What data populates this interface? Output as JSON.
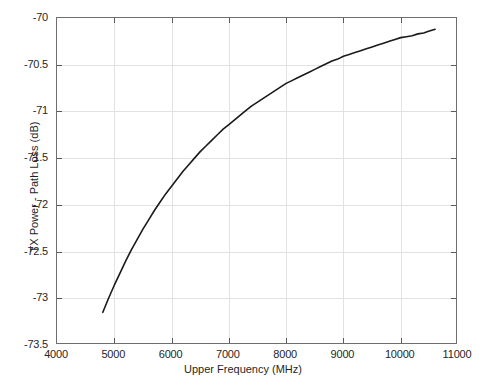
{
  "chart_data": {
    "type": "line",
    "title": "",
    "xlabel": "Upper Frequency (MHz)",
    "ylabel": "TX Power - Path Loss (dB)",
    "xlim": [
      4000,
      11000
    ],
    "ylim": [
      -73.5,
      -70
    ],
    "xticks": [
      4000,
      5000,
      6000,
      7000,
      8000,
      9000,
      10000,
      11000
    ],
    "xticklabels": [
      "4000",
      "5000",
      "6000",
      "7000",
      "8000",
      "9000",
      "10000",
      "11000"
    ],
    "yticks": [
      -73.5,
      -73,
      -72.5,
      -72,
      -71.5,
      -71,
      -70.5,
      -70
    ],
    "yticklabels": [
      "-73.5",
      "-73",
      "-72.5",
      "-72",
      "-71.5",
      "-71",
      "-70.5",
      "-70"
    ],
    "grid": true,
    "legend": null,
    "series": [
      {
        "name": "TX Power - Path Loss",
        "color": "#1a1a1a",
        "linewidth": 1.6,
        "x": [
          4800,
          4900,
          5000,
          5100,
          5200,
          5300,
          5400,
          5500,
          5600,
          5700,
          5800,
          5900,
          6000,
          6100,
          6200,
          6300,
          6400,
          6500,
          6600,
          6700,
          6800,
          6900,
          7000,
          7100,
          7200,
          7300,
          7400,
          7500,
          7600,
          7700,
          7800,
          7900,
          8000,
          8100,
          8200,
          8300,
          8400,
          8500,
          8600,
          8700,
          8800,
          8900,
          9000,
          9100,
          9200,
          9300,
          9400,
          9500,
          9600,
          9700,
          9800,
          9900,
          10000,
          10100,
          10200,
          10300,
          10400,
          10500,
          10600
        ],
        "y": [
          -73.15,
          -73.0,
          -72.86,
          -72.73,
          -72.6,
          -72.48,
          -72.37,
          -72.26,
          -72.16,
          -72.06,
          -71.97,
          -71.88,
          -71.8,
          -71.72,
          -71.64,
          -71.57,
          -71.5,
          -71.43,
          -71.37,
          -71.31,
          -71.25,
          -71.19,
          -71.14,
          -71.09,
          -71.04,
          -70.99,
          -70.94,
          -70.9,
          -70.86,
          -70.82,
          -70.78,
          -70.74,
          -70.7,
          -70.67,
          -70.64,
          -70.61,
          -70.58,
          -70.55,
          -70.52,
          -70.49,
          -70.46,
          -70.44,
          -70.41,
          -70.39,
          -70.37,
          -70.35,
          -70.33,
          -70.31,
          -70.29,
          -70.27,
          -70.25,
          -70.23,
          -70.21,
          -70.2,
          -70.19,
          -70.17,
          -70.16,
          -70.14,
          -70.12
        ]
      }
    ]
  },
  "figure": {
    "xlabel": "Upper Frequency (MHz)",
    "ylabel": "TX Power - Path Loss (dB)",
    "caption": ""
  },
  "colors": {
    "curve": "#1a1a1a",
    "grid": "#e2e2e2",
    "axis": "#6f6f6f",
    "text": "#262626",
    "background": "#ffffff"
  }
}
